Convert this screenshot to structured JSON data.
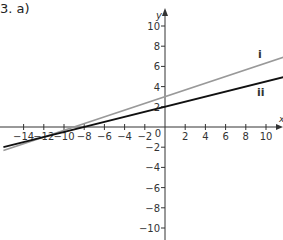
{
  "question_label": "3.  a)",
  "chart_data": {
    "type": "line",
    "title": "",
    "xlabel": "x",
    "ylabel": "y",
    "xlim": [
      -16,
      11.8
    ],
    "ylim": [
      -11,
      11.5
    ],
    "grid": false,
    "x_ticks": [
      -14,
      -12,
      -10,
      -8,
      -6,
      -4,
      -2,
      0,
      2,
      4,
      6,
      8,
      10
    ],
    "y_ticks": [
      -10,
      -8,
      -6,
      -4,
      -2,
      2,
      4,
      6,
      8,
      10
    ],
    "series": [
      {
        "name": "i",
        "color": "#999999",
        "slope": 0.3333,
        "intercept": 3,
        "x": [
          -16,
          11.8
        ],
        "y": [
          -2.33,
          6.93
        ]
      },
      {
        "name": "ii",
        "color": "#111111",
        "slope": 0.25,
        "intercept": 2,
        "x": [
          -16,
          11.8
        ],
        "y": [
          -2,
          4.95
        ]
      }
    ]
  }
}
